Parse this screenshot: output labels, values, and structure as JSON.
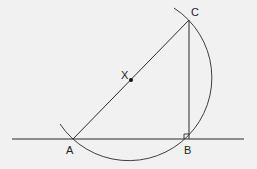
{
  "diagram": {
    "background": "#f1f1f1",
    "stroke_color": "#2a2a2a",
    "points": {
      "A": {
        "label": "A",
        "x": 73,
        "y": 139
      },
      "B": {
        "label": "B",
        "x": 189,
        "y": 139
      },
      "C": {
        "label": "C",
        "x": 189,
        "y": 20
      },
      "X": {
        "label": "X",
        "x": 131,
        "y": 80
      }
    },
    "labels": {
      "A": "A",
      "B": "B",
      "C": "C",
      "X": "X"
    },
    "line": {
      "x1": 12,
      "y1": 139,
      "x2": 244,
      "y2": 139
    },
    "circle": {
      "center": "X",
      "radius": 83
    },
    "right_angle_at": "B"
  }
}
